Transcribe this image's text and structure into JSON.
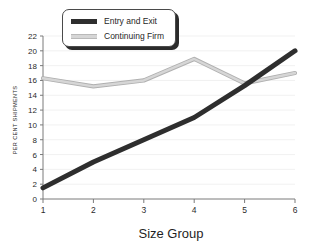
{
  "chart_data": {
    "type": "line",
    "title": "",
    "xlabel": "Size Group",
    "ylabel": "PER CENT SHIPMENTS",
    "categories": [
      "1",
      "2",
      "3",
      "4",
      "5",
      "6"
    ],
    "x": [
      1,
      2,
      3,
      4,
      5,
      6
    ],
    "xlim": [
      1,
      6
    ],
    "ylim": [
      0,
      22
    ],
    "yticks": [
      0,
      2,
      4,
      6,
      8,
      10,
      12,
      14,
      16,
      18,
      20,
      22
    ],
    "xticks": [
      1,
      2,
      3,
      4,
      5,
      6
    ],
    "grid": true,
    "legend_position": "top-left",
    "series": [
      {
        "name": "Entry and Exit",
        "color": "#2e2e2e",
        "values": [
          1.5,
          5.0,
          8.0,
          11.0,
          15.3,
          20.0
        ]
      },
      {
        "name": "Continuing Firm",
        "color": "#d6d6d6",
        "values": [
          16.3,
          15.2,
          16.0,
          18.9,
          15.6,
          17.0
        ]
      }
    ]
  },
  "legend": {
    "entries": [
      {
        "label": "Entry and Exit",
        "swatch": "dark-line-swatch"
      },
      {
        "label": "Continuing Firm",
        "swatch": "light-line-swatch"
      }
    ]
  },
  "axes": {
    "y_tick_labels": [
      "0",
      "2",
      "4",
      "6",
      "8",
      "10",
      "12",
      "14",
      "16",
      "18",
      "20",
      "22"
    ],
    "x_tick_labels": [
      "1",
      "2",
      "3",
      "4",
      "5",
      "6"
    ],
    "x_title": "Size Group",
    "y_title": "PER CENT SHIPMENTS"
  }
}
